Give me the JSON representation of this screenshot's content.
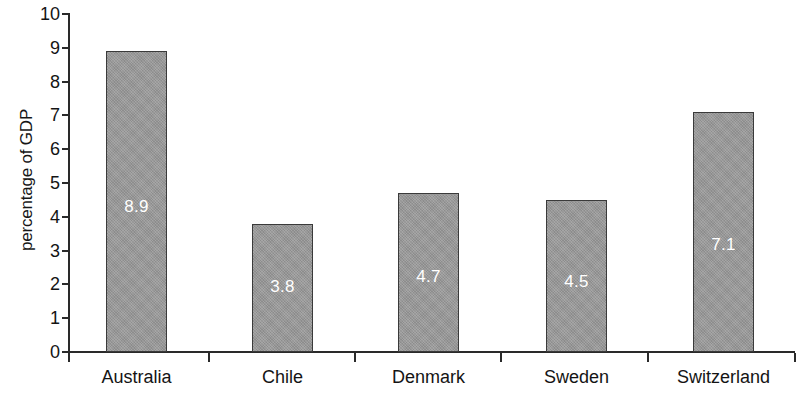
{
  "chart_data": {
    "type": "bar",
    "title": "",
    "xlabel": "",
    "ylabel": "percentage of GDP",
    "categories": [
      "Australia",
      "Chile",
      "Denmark",
      "Sweden",
      "Switzerland"
    ],
    "values": [
      8.9,
      3.8,
      4.7,
      4.5,
      7.1
    ],
    "value_labels": [
      "8.9",
      "3.8",
      "4.7",
      "4.5",
      "7.1"
    ],
    "ylim": [
      0,
      10
    ],
    "y_ticks": [
      "10",
      "9",
      "8",
      "7",
      "6",
      "5",
      "4",
      "3",
      "2",
      "1",
      "0"
    ],
    "grid": false,
    "legend": false,
    "legend_position": "none",
    "bar_color": "#9a9a9a",
    "bar_border_color": "#3a3a3a",
    "value_label_color": "#ffffff",
    "axis_color": "#2a2a2a"
  },
  "axis": {
    "y_title": "percentage of GDP"
  }
}
